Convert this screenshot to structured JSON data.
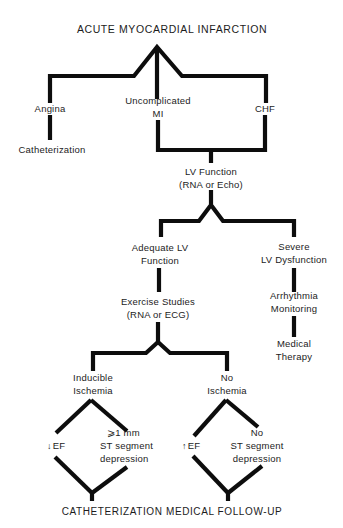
{
  "diagram": {
    "title": "ACUTE MYOCARDIAL INFARCTION",
    "colors": {
      "line": "#0d0d0d",
      "text": "#1c1c1c",
      "background": "#ffffff"
    },
    "level1": {
      "angina": "Angina",
      "angina_result": "Catheterization",
      "uncomplicated_line1": "Uncomplicated",
      "uncomplicated_line2": "MI",
      "chf": "CHF"
    },
    "lv_function": {
      "line1": "LV Function",
      "line2": "(RNA or Echo)"
    },
    "adequate": {
      "line1": "Adequate LV",
      "line2": "Function"
    },
    "severe": {
      "line1": "Severe",
      "line2": "LV Dysfunction"
    },
    "arrhythmia": {
      "line1": "Arrhythmia",
      "line2": "Monitoring"
    },
    "medical_therapy": {
      "line1": "Medical",
      "line2": "Therapy"
    },
    "exercise": {
      "line1": "Exercise Studies",
      "line2": "(RNA or ECG)"
    },
    "inducible": {
      "line1": "Inducible",
      "line2": "Ischemia",
      "ef_arrow": "↓",
      "ef": "EF",
      "st_line1": "⩾1 mm",
      "st_line2": "ST  segment",
      "st_line3": "depression"
    },
    "no_ischemia": {
      "line1": "No",
      "line2": "Ischemia",
      "ef_arrow": "↑",
      "ef": "EF",
      "st_line1": "No",
      "st_line2": "ST  segment",
      "st_line3": "depression"
    },
    "outcomes": "CATHETERIZATION MEDICAL FOLLOW-UP"
  }
}
